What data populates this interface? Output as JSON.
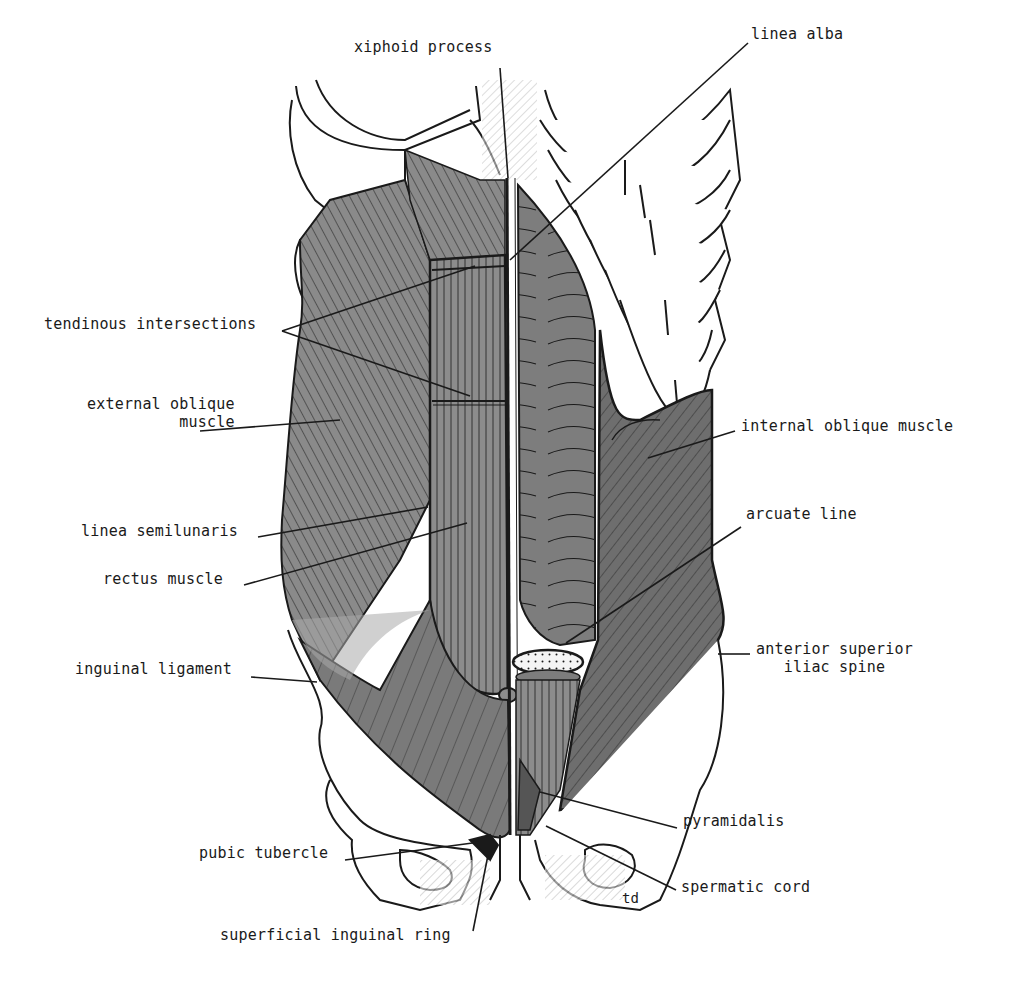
{
  "figure": {
    "colors": {
      "background": "#ffffff",
      "ink": "#1a1a1a",
      "muscle_dark": "#6e6e6e",
      "muscle_mid": "#8a8a8a",
      "muscle_light": "#a9a9a9",
      "bone": "#ffffff",
      "aponeurosis_light": "#b8b8b8"
    },
    "artist_mark": "td"
  },
  "labels": [
    {
      "id": "xiphoid-process",
      "text": "xiphoid process",
      "x": 354,
      "y": 46,
      "align": "left",
      "leader": [
        [
          500,
          68
        ],
        [
          508,
          178
        ]
      ]
    },
    {
      "id": "linea-alba",
      "text": "linea alba",
      "x": 751,
      "y": 33,
      "align": "left",
      "leader": [
        [
          748,
          43
        ],
        [
          510,
          260
        ]
      ]
    },
    {
      "id": "tendinous-intersections",
      "text": "tendinous intersections",
      "x": 44,
      "y": 323,
      "align": "left",
      "leader": [
        [
          282,
          331
        ],
        [
          475,
          266
        ]
      ],
      "leader2": [
        [
          282,
          331
        ],
        [
          470,
          396
        ]
      ]
    },
    {
      "id": "external-oblique-muscle",
      "text": "external oblique\n    muscle",
      "x": 87,
      "y": 403,
      "align": "left",
      "leader": [
        [
          200,
          431
        ],
        [
          340,
          420
        ]
      ]
    },
    {
      "id": "internal-oblique-muscle",
      "text": "internal oblique muscle",
      "x": 741,
      "y": 425,
      "align": "left",
      "leader": [
        [
          735,
          431
        ],
        [
          648,
          458
        ]
      ]
    },
    {
      "id": "linea-semilunaris",
      "text": "linea semilunaris",
      "x": 81,
      "y": 530,
      "align": "left",
      "leader": [
        [
          258,
          537
        ],
        [
          428,
          507
        ]
      ]
    },
    {
      "id": "rectus-muscle",
      "text": "rectus muscle",
      "x": 103,
      "y": 578,
      "align": "left",
      "leader": [
        [
          244,
          585
        ],
        [
          467,
          523
        ]
      ]
    },
    {
      "id": "arcuate-line",
      "text": "arcuate line",
      "x": 746,
      "y": 513,
      "align": "left",
      "leader": [
        [
          741,
          527
        ],
        [
          566,
          643
        ]
      ]
    },
    {
      "id": "anterior-superior-iliac-spine",
      "text": "anterior superior\n   iliac spine",
      "x": 756,
      "y": 648,
      "align": "left",
      "leader": [
        [
          750,
          654
        ],
        [
          718,
          654
        ]
      ]
    },
    {
      "id": "inguinal-ligament",
      "text": "inguinal ligament",
      "x": 75,
      "y": 668,
      "align": "left",
      "leader": [
        [
          251,
          677
        ],
        [
          317,
          682
        ]
      ]
    },
    {
      "id": "pyramidalis",
      "text": "pyramidalis",
      "x": 683,
      "y": 820,
      "align": "left",
      "leader": [
        [
          677,
          828
        ],
        [
          540,
          792
        ]
      ]
    },
    {
      "id": "pubic-tubercle",
      "text": "pubic tubercle",
      "x": 199,
      "y": 852,
      "align": "left",
      "leader": [
        [
          345,
          860
        ],
        [
          480,
          842
        ]
      ]
    },
    {
      "id": "spermatic-cord",
      "text": "spermatic cord",
      "x": 681,
      "y": 886,
      "align": "left",
      "leader": [
        [
          676,
          890
        ],
        [
          546,
          826
        ]
      ]
    },
    {
      "id": "superficial-inguinal-ring",
      "text": "superficial inguinal ring",
      "x": 220,
      "y": 934,
      "align": "left",
      "leader": [
        [
          473,
          931
        ],
        [
          488,
          855
        ]
      ]
    }
  ]
}
